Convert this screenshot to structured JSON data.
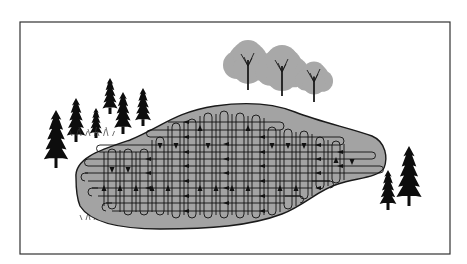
{
  "figure": {
    "width": 467,
    "height": 264,
    "frame": {
      "x": 20,
      "y": 22,
      "w": 430,
      "h": 232,
      "stroke": "#333333"
    },
    "colors": {
      "lake_fill": "#a3a3a3",
      "lake_stroke": "#1a1a1a",
      "grid_line": "#111111",
      "conifer": "#0d0d0d",
      "deciduous_canopy": "#a8a8a8",
      "deciduous_trunk": "#1a1a1a",
      "grass": "#333333"
    }
  },
  "lake": {
    "path": "M 76 178 C 74 158, 100 150, 130 140 C 160 128, 175 112, 215 106 C 250 101, 275 104, 295 112 C 320 122, 350 128, 372 136 C 386 142, 388 158, 384 168 C 378 178, 355 178, 338 184 C 318 190, 305 205, 282 214 C 250 226, 210 229, 160 229 C 120 229, 90 222, 80 206 C 76 196, 76 186, 76 178 Z"
  },
  "search_pattern": {
    "label": "grid-search-pattern",
    "vertical_columns": [
      {
        "x": 104,
        "y1": 152,
        "y2": 206
      },
      {
        "x": 120,
        "y1": 150,
        "y2": 212
      },
      {
        "x": 136,
        "y1": 152,
        "y2": 212
      },
      {
        "x": 152,
        "y1": 140,
        "y2": 212
      },
      {
        "x": 168,
        "y1": 126,
        "y2": 215
      },
      {
        "x": 184,
        "y1": 122,
        "y2": 215
      },
      {
        "x": 200,
        "y1": 116,
        "y2": 215
      },
      {
        "x": 216,
        "y1": 114,
        "y2": 215
      },
      {
        "x": 232,
        "y1": 114,
        "y2": 215
      },
      {
        "x": 248,
        "y1": 116,
        "y2": 215
      },
      {
        "x": 264,
        "y1": 118,
        "y2": 215
      },
      {
        "x": 280,
        "y1": 130,
        "y2": 212
      },
      {
        "x": 296,
        "y1": 132,
        "y2": 206
      },
      {
        "x": 312,
        "y1": 134,
        "y2": 196
      },
      {
        "x": 328,
        "y1": 140,
        "y2": 186
      },
      {
        "x": 344,
        "y1": 144,
        "y2": 180
      }
    ],
    "horizontal_rows": [
      {
        "y": 122,
        "x1": 168,
        "x2": 275
      },
      {
        "y": 130,
        "x1": 160,
        "x2": 280
      },
      {
        "y": 137,
        "x1": 150,
        "x2": 320
      },
      {
        "x1": 140,
        "x2": 340,
        "y": 145
      },
      {
        "y": 152,
        "x1": 100,
        "x2": 360
      },
      {
        "y": 159,
        "x1": 95,
        "x2": 372
      },
      {
        "y": 166,
        "x1": 88,
        "x2": 380
      },
      {
        "y": 173,
        "x1": 85,
        "x2": 380
      },
      {
        "y": 181,
        "x1": 88,
        "x2": 330
      },
      {
        "y": 188,
        "x1": 92,
        "x2": 312
      },
      {
        "y": 196,
        "x1": 98,
        "x2": 300
      },
      {
        "y": 203,
        "x1": 106,
        "x2": 285
      },
      {
        "y": 211,
        "x1": 112,
        "x2": 268
      }
    ],
    "arrows_down": [
      [
        112,
        170
      ],
      [
        128,
        170
      ],
      [
        160,
        146
      ],
      [
        176,
        146
      ],
      [
        208,
        146
      ],
      [
        272,
        146
      ],
      [
        288,
        146
      ],
      [
        304,
        146
      ],
      [
        352,
        162
      ]
    ],
    "arrows_up": [
      [
        104,
        188
      ],
      [
        120,
        188
      ],
      [
        136,
        188
      ],
      [
        152,
        188
      ],
      [
        168,
        188
      ],
      [
        200,
        188
      ],
      [
        216,
        188
      ],
      [
        232,
        188
      ],
      [
        248,
        188
      ],
      [
        280,
        188
      ],
      [
        296,
        188
      ],
      [
        200,
        128
      ],
      [
        248,
        128
      ],
      [
        336,
        160
      ]
    ],
    "arrows_left": [
      [
        148,
        159
      ],
      [
        148,
        173
      ],
      [
        148,
        188
      ],
      [
        186,
        122
      ],
      [
        186,
        137
      ],
      [
        186,
        152
      ],
      [
        186,
        166
      ],
      [
        186,
        181
      ],
      [
        186,
        196
      ],
      [
        186,
        211
      ],
      [
        226,
        144
      ],
      [
        226,
        159
      ],
      [
        226,
        173
      ],
      [
        226,
        188
      ],
      [
        226,
        203
      ],
      [
        262,
        137
      ],
      [
        262,
        152
      ],
      [
        262,
        166
      ],
      [
        262,
        181
      ],
      [
        262,
        196
      ],
      [
        262,
        211
      ],
      [
        318,
        145
      ],
      [
        318,
        159
      ],
      [
        318,
        173
      ],
      [
        318,
        188
      ],
      [
        340,
        152
      ],
      [
        340,
        166
      ]
    ]
  },
  "conifers_left": [
    {
      "x": 56,
      "y": 110,
      "h": 58
    },
    {
      "x": 76,
      "y": 98,
      "h": 44
    },
    {
      "x": 96,
      "y": 108,
      "h": 30
    },
    {
      "x": 110,
      "y": 78,
      "h": 36
    },
    {
      "x": 123,
      "y": 92,
      "h": 42
    },
    {
      "x": 143,
      "y": 88,
      "h": 38
    }
  ],
  "conifers_right": [
    {
      "x": 388,
      "y": 170,
      "h": 40
    },
    {
      "x": 409,
      "y": 146,
      "h": 60
    }
  ],
  "deciduous_trees": [
    {
      "cx": 248,
      "cy": 62,
      "r": 20,
      "trunk_bottom": 90
    },
    {
      "cx": 282,
      "cy": 68,
      "r": 21,
      "trunk_bottom": 96
    },
    {
      "cx": 314,
      "cy": 78,
      "r": 15,
      "trunk_bottom": 102
    }
  ],
  "grass_tufts": [
    {
      "x": 72,
      "y": 136,
      "w": 45
    },
    {
      "x": 82,
      "y": 220,
      "w": 40
    }
  ]
}
